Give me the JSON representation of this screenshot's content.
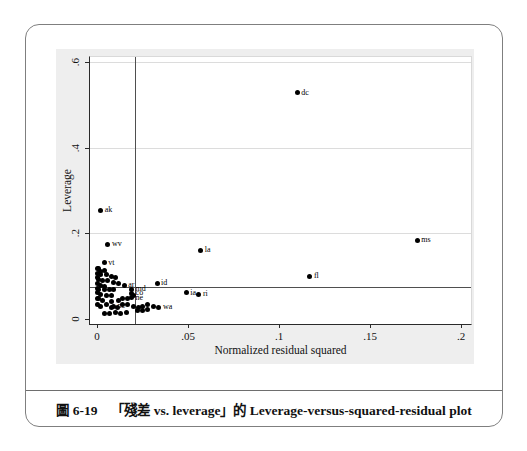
{
  "caption": {
    "figure_label": "圖 6-19",
    "title": "「殘差 vs. leverage」的 Leverage-versus-squared-residual plot"
  },
  "chart_data": {
    "type": "scatter",
    "xlabel": "Normalized residual squared",
    "ylabel": "Leverage",
    "xlim": [
      0,
      0.2
    ],
    "ylim": [
      0,
      0.6
    ],
    "x_ticks": [
      "0",
      ".05",
      ".1",
      ".15",
      ".2"
    ],
    "x_tick_values": [
      0,
      0.05,
      0.1,
      0.15,
      0.2
    ],
    "y_ticks": [
      "0",
      ".2",
      ".4",
      ".6"
    ],
    "y_tick_values": [
      0,
      0.2,
      0.4,
      0.6
    ],
    "grid": "horizontal-only",
    "marker_color": "#000000",
    "grid_color": "#dcdcdc",
    "reference_lines": {
      "vertical_x": 0.021,
      "horizontal_y": 0.075
    },
    "labeled_points": [
      {
        "label": "dc",
        "x": 0.11,
        "y": 0.528
      },
      {
        "label": "ms",
        "x": 0.176,
        "y": 0.184
      },
      {
        "label": "ak",
        "x": 0.002,
        "y": 0.254
      },
      {
        "label": "wv",
        "x": 0.006,
        "y": 0.175
      },
      {
        "label": "vt",
        "x": 0.004,
        "y": 0.131
      },
      {
        "label": "la",
        "x": 0.057,
        "y": 0.161
      },
      {
        "label": "fl",
        "x": 0.117,
        "y": 0.1
      },
      {
        "label": "id",
        "x": 0.033,
        "y": 0.084
      },
      {
        "label": "ia",
        "x": 0.049,
        "y": 0.061
      },
      {
        "label": "ri",
        "x": 0.056,
        "y": 0.058
      },
      {
        "label": "wa",
        "x": 0.034,
        "y": 0.028
      },
      {
        "label": "md",
        "x": 0.019,
        "y": 0.07
      },
      {
        "label": "co",
        "x": 0.019,
        "y": 0.06
      },
      {
        "label": "ne",
        "x": 0.019,
        "y": 0.05
      },
      {
        "label": "ar",
        "x": 0.015,
        "y": 0.079
      },
      {
        "label": "nc",
        "x": 0.009,
        "y": 0.03
      }
    ],
    "cluster_points": [
      [
        0.0,
        0.119
      ],
      [
        0.001,
        0.117
      ],
      [
        0.002,
        0.112
      ],
      [
        0.004,
        0.114
      ],
      [
        0.0,
        0.107
      ],
      [
        0.002,
        0.105
      ],
      [
        0.005,
        0.105
      ],
      [
        0.008,
        0.1
      ],
      [
        0.01,
        0.096
      ],
      [
        0.0,
        0.098
      ],
      [
        0.001,
        0.093
      ],
      [
        0.003,
        0.091
      ],
      [
        0.006,
        0.089
      ],
      [
        0.009,
        0.086
      ],
      [
        0.012,
        0.084
      ],
      [
        0.0,
        0.084
      ],
      [
        0.002,
        0.079
      ],
      [
        0.004,
        0.077
      ],
      [
        0.0,
        0.072
      ],
      [
        0.001,
        0.07
      ],
      [
        0.004,
        0.068
      ],
      [
        0.007,
        0.068
      ],
      [
        0.009,
        0.07
      ],
      [
        0.0,
        0.061
      ],
      [
        0.002,
        0.058
      ],
      [
        0.005,
        0.056
      ],
      [
        0.008,
        0.054
      ],
      [
        0.0,
        0.049
      ],
      [
        0.001,
        0.047
      ],
      [
        0.003,
        0.044
      ],
      [
        0.008,
        0.042
      ],
      [
        0.012,
        0.044
      ],
      [
        0.014,
        0.047
      ],
      [
        0.017,
        0.049
      ],
      [
        0.02,
        0.054
      ],
      [
        0.014,
        0.035
      ],
      [
        0.017,
        0.033
      ],
      [
        0.02,
        0.03
      ],
      [
        0.023,
        0.028
      ],
      [
        0.025,
        0.03
      ],
      [
        0.028,
        0.033
      ],
      [
        0.031,
        0.03
      ],
      [
        0.005,
        0.033
      ],
      [
        0.008,
        0.028
      ],
      [
        0.011,
        0.026
      ],
      [
        0.002,
        0.03
      ],
      [
        0.0,
        0.033
      ],
      [
        0.01,
        0.016
      ],
      [
        0.013,
        0.014
      ],
      [
        0.016,
        0.016
      ],
      [
        0.022,
        0.019
      ],
      [
        0.025,
        0.021
      ],
      [
        0.028,
        0.023
      ],
      [
        0.007,
        0.012
      ],
      [
        0.004,
        0.014
      ]
    ]
  }
}
